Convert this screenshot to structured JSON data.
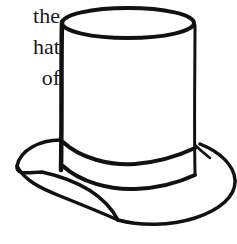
{
  "text_fragment": {
    "lines": [
      "the",
      "hat",
      "of"
    ]
  },
  "illustration": {
    "subject": "top hat line drawing",
    "stroke_color": "#111111",
    "background_color": "#ffffff"
  }
}
